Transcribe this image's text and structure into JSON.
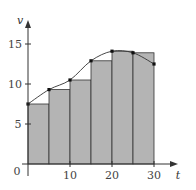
{
  "chart_data": {
    "type": "bar",
    "subtype": "riemann-sum-left-endpoints-with-curve",
    "title": "",
    "xlabel": "t",
    "ylabel": "v",
    "x_ticks": [
      0,
      10,
      20,
      30
    ],
    "y_ticks": [
      5,
      10,
      15
    ],
    "xlim": [
      0,
      34
    ],
    "ylim": [
      0,
      18
    ],
    "grid": false,
    "legend": null,
    "curve_points": {
      "x": [
        0,
        5,
        10,
        15,
        20,
        25,
        30
      ],
      "y": [
        7.5,
        9.3,
        10.5,
        12.9,
        14.1,
        13.9,
        12.5
      ]
    },
    "bars": {
      "left_edges": [
        0,
        5,
        10,
        15,
        20,
        25
      ],
      "width": 5,
      "heights": [
        7.5,
        9.3,
        10.5,
        12.9,
        14.1,
        13.9
      ]
    },
    "colors": {
      "bar_fill": "#b4b4b4",
      "bar_edge": "#333333",
      "curve": "#333333",
      "point": "#111111",
      "axis": "#333333"
    }
  },
  "labels": {
    "origin": "0",
    "x_axis": "t",
    "y_axis": "v",
    "x_tick_10": "10",
    "x_tick_20": "20",
    "x_tick_30": "30",
    "y_tick_5": "5",
    "y_tick_10": "10",
    "y_tick_15": "15"
  }
}
